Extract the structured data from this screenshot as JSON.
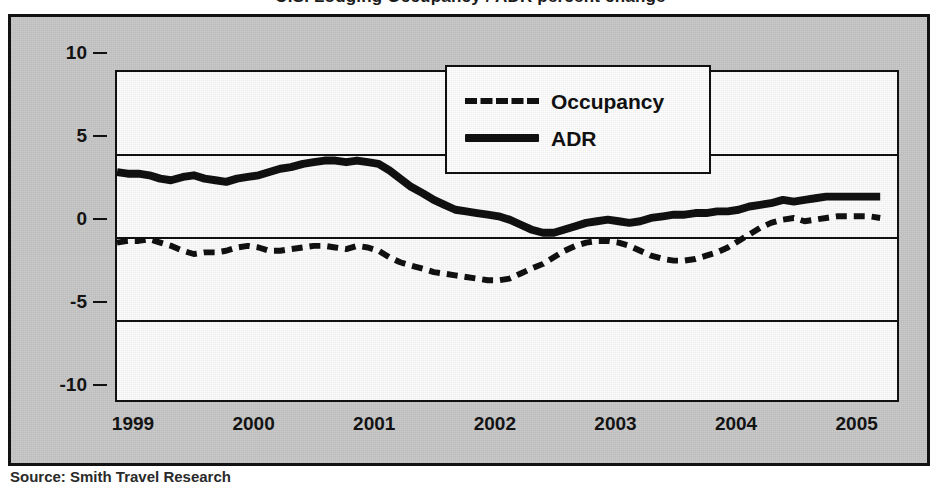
{
  "figure": {
    "title": "U.S. Lodging Occupancy / ADR percent change",
    "source": "Source: Smith Travel Research",
    "background_color": "#c9c9c9",
    "plot_background_color": "#fdfdfd",
    "line_color": "#111111"
  },
  "legend": {
    "position": "top-center",
    "items": [
      {
        "label": "Occupancy",
        "style": "dashed",
        "icon": "dashed-line-swatch"
      },
      {
        "label": "ADR",
        "style": "solid",
        "icon": "solid-line-swatch"
      }
    ]
  },
  "axes": {
    "y_ticks": [
      "10",
      "5",
      "0",
      "-5",
      "-10"
    ],
    "x_ticks": [
      "1999",
      "2000",
      "2001",
      "2002",
      "2003",
      "2004",
      "2005"
    ]
  },
  "chart_data": {
    "type": "line",
    "title": "U.S. Lodging Occupancy / ADR percent change",
    "xlabel": "",
    "ylabel": "",
    "ylim": [
      -10,
      10
    ],
    "xlim": [
      1999.0,
      2005.5
    ],
    "yticks": [
      10,
      5,
      0,
      -5,
      -10
    ],
    "xticks": [
      1999,
      2000,
      2001,
      2002,
      2003,
      2004,
      2005
    ],
    "grid": true,
    "legend_position": "top-center",
    "x": [
      1999.0,
      1999.09,
      1999.18,
      1999.27,
      1999.36,
      1999.45,
      1999.55,
      1999.64,
      1999.73,
      1999.82,
      1999.91,
      2000.0,
      2000.09,
      2000.18,
      2000.27,
      2000.36,
      2000.45,
      2000.55,
      2000.64,
      2000.73,
      2000.82,
      2000.91,
      2001.0,
      2001.09,
      2001.18,
      2001.27,
      2001.36,
      2001.45,
      2001.55,
      2001.64,
      2001.73,
      2001.82,
      2001.91,
      2002.0,
      2002.09,
      2002.18,
      2002.27,
      2002.36,
      2002.45,
      2002.55,
      2002.64,
      2002.73,
      2002.82,
      2002.91,
      2003.0,
      2003.09,
      2003.18,
      2003.27,
      2003.36,
      2003.45,
      2003.55,
      2003.64,
      2003.73,
      2003.82,
      2003.91,
      2004.0,
      2004.09,
      2004.18,
      2004.27,
      2004.36,
      2004.45,
      2004.55,
      2004.64,
      2004.73,
      2004.82,
      2004.91,
      2005.0,
      2005.09,
      2005.18,
      2005.27,
      2005.36
    ],
    "series": [
      {
        "name": "ADR",
        "style": "solid",
        "color": "#111111",
        "values": [
          3.9,
          3.8,
          3.8,
          3.7,
          3.5,
          3.4,
          3.6,
          3.7,
          3.5,
          3.4,
          3.3,
          3.5,
          3.6,
          3.7,
          3.9,
          4.1,
          4.2,
          4.4,
          4.5,
          4.6,
          4.6,
          4.5,
          4.6,
          4.5,
          4.4,
          4.0,
          3.5,
          3.0,
          2.6,
          2.2,
          1.9,
          1.6,
          1.5,
          1.4,
          1.3,
          1.2,
          1.0,
          0.7,
          0.4,
          0.2,
          0.2,
          0.4,
          0.6,
          0.8,
          0.9,
          1.0,
          0.9,
          0.8,
          0.9,
          1.1,
          1.2,
          1.3,
          1.3,
          1.4,
          1.4,
          1.5,
          1.5,
          1.6,
          1.8,
          1.9,
          2.0,
          2.2,
          2.1,
          2.2,
          2.3,
          2.4,
          2.4,
          2.4,
          2.4,
          2.4,
          2.4
        ]
      },
      {
        "name": "Occupancy",
        "style": "dashed",
        "color": "#111111",
        "values": [
          -0.4,
          -0.3,
          -0.3,
          -0.2,
          -0.4,
          -0.6,
          -0.9,
          -1.1,
          -1.0,
          -1.0,
          -0.9,
          -0.7,
          -0.6,
          -0.7,
          -0.9,
          -0.9,
          -0.8,
          -0.7,
          -0.6,
          -0.6,
          -0.7,
          -0.8,
          -0.6,
          -0.7,
          -0.9,
          -1.3,
          -1.6,
          -1.8,
          -2.0,
          -2.2,
          -2.3,
          -2.4,
          -2.5,
          -2.6,
          -2.7,
          -2.7,
          -2.6,
          -2.3,
          -2.0,
          -1.7,
          -1.3,
          -0.9,
          -0.6,
          -0.4,
          -0.3,
          -0.3,
          -0.4,
          -0.6,
          -0.9,
          -1.2,
          -1.4,
          -1.5,
          -1.5,
          -1.4,
          -1.2,
          -1.0,
          -0.7,
          -0.3,
          0.1,
          0.5,
          0.8,
          1.0,
          1.1,
          0.9,
          1.0,
          1.1,
          1.2,
          1.2,
          1.2,
          1.2,
          1.1
        ]
      }
    ]
  }
}
